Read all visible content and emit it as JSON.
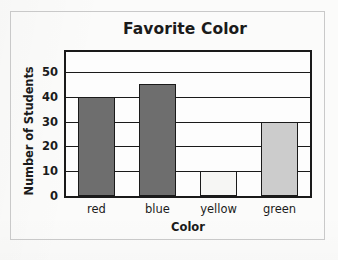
{
  "frame": {
    "border_color": "#c9c9c9",
    "background": "#fbfbfa"
  },
  "chart_data": {
    "type": "bar",
    "title": "Favorite Color",
    "xlabel": "Color",
    "ylabel": "Number of Students",
    "categories": [
      "red",
      "blue",
      "yellow",
      "green"
    ],
    "values": [
      40,
      45,
      10,
      30
    ],
    "bar_colors": [
      "#6e6e6e",
      "#6e6e6e",
      "#f6f6f4",
      "#cccccc"
    ],
    "bar_border_color": "#1a1a1a",
    "ylim": [
      0,
      58
    ],
    "yticks": [
      0,
      10,
      20,
      30,
      40,
      50
    ],
    "ytick_labels": [
      "0",
      "10",
      "20",
      "30",
      "40",
      "50"
    ],
    "grid": true,
    "grid_color": "#1a1a1a",
    "legend": false,
    "axis_color": "#1a1a1a",
    "plot_background": "#fdfdfd"
  }
}
